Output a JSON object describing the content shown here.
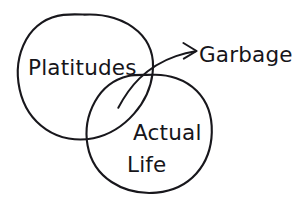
{
  "diagram": {
    "type": "venn-diagram",
    "style": "hand-drawn-sketch",
    "background_color": "#ffffff",
    "ink_color": "#18171c",
    "title": "",
    "sets": [
      {
        "id": "platitudes",
        "label": "Platitudes",
        "position": "upper-left",
        "label_x": 28,
        "label_y": 75
      },
      {
        "id": "actual-life",
        "label": "Actual Life",
        "label_line_1": "Actual",
        "label_line_2": "Life",
        "position": "lower-right",
        "label_x": 133,
        "label_y": 140
      }
    ],
    "annotations": [
      {
        "id": "garbage-callout",
        "label": "Garbage",
        "points_to": "intersection",
        "has_arrow": true,
        "arrow_direction": "right",
        "label_x": 199,
        "label_y": 62
      }
    ],
    "intersection": {
      "from_set": "platitudes",
      "to_set": "actual-life",
      "labelled_as": "Garbage"
    }
  }
}
